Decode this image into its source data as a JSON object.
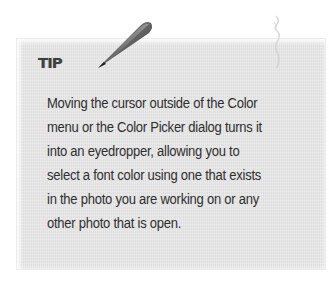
{
  "tip": {
    "heading": "TIP",
    "lines": [
      "Moving the cursor outside of the Color",
      "menu or the Color Picker dialog turns it",
      "into an eyedropper, allowing you to",
      "select a font color using one that exists",
      "in the photo you are working on or any",
      "other photo that is open."
    ],
    "icon": "pen-icon"
  },
  "colors": {
    "panel_background": "#e6e6e6",
    "text": "#2f2f2f",
    "heading": "#3f3f3f",
    "page_background": "#ffffff"
  }
}
